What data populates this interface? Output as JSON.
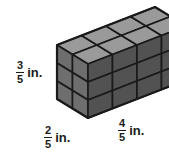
{
  "figure": {
    "name": "rectangular-prism-unit-cubes",
    "shape": "rectangular prism built from unit cubes",
    "unit_cube_edge": "1/5 in.",
    "colors": {
      "top_face": "#9a9a9a",
      "left_face": "#6e6e6e",
      "right_face": "#525252",
      "edge": "#1a1a1a",
      "background": "#ffffff",
      "text": "#1a1a1a"
    },
    "cube_counts": {
      "width_cubes": 4,
      "height_cubes": 3,
      "depth_cubes": 2,
      "total_cubes": 24
    }
  },
  "labels": {
    "height": {
      "name": "height-label",
      "numerator": "3",
      "denominator": "5",
      "unit": "in."
    },
    "depth": {
      "name": "depth-label",
      "numerator": "2",
      "denominator": "5",
      "unit": "in."
    },
    "width": {
      "name": "width-label",
      "numerator": "4",
      "denominator": "5",
      "unit": "in."
    }
  }
}
